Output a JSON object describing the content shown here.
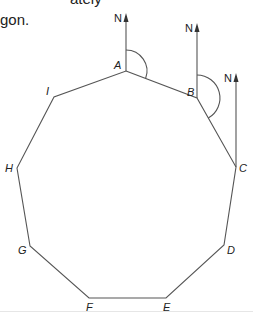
{
  "intro_text": {
    "line1": "ately",
    "line2": "gon."
  },
  "diagram": {
    "vertices": [
      {
        "label": "A",
        "x": 126,
        "y": 71
      },
      {
        "label": "B",
        "x": 197,
        "y": 98
      },
      {
        "label": "C",
        "x": 236,
        "y": 167
      },
      {
        "label": "D",
        "x": 224,
        "y": 245
      },
      {
        "label": "E",
        "x": 166,
        "y": 298
      },
      {
        "label": "F",
        "x": 89,
        "y": 298
      },
      {
        "label": "G",
        "x": 30,
        "y": 246
      },
      {
        "label": "H",
        "x": 17,
        "y": 168
      },
      {
        "label": "I",
        "x": 54,
        "y": 97
      }
    ],
    "north_label": "N",
    "north_arrows": [
      {
        "at": "A",
        "x": 126,
        "top": 14
      },
      {
        "at": "B",
        "x": 197,
        "top": 24
      },
      {
        "at": "C",
        "x": 236,
        "top": 72
      }
    ],
    "bearing_arcs": [
      {
        "at": "A",
        "radius": 21
      },
      {
        "at": "B",
        "radius": 23
      }
    ],
    "colors": {
      "line": "#555555",
      "text": "#222222"
    }
  }
}
